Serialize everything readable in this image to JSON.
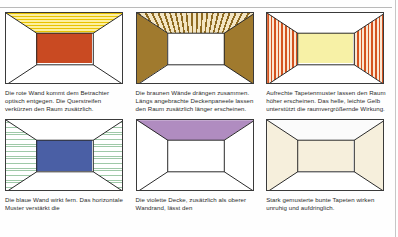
{
  "page": {
    "rule_color": "#b9b9b9"
  },
  "panels": [
    {
      "id": "panel-red-wall",
      "room_name": "room-red-back-wall",
      "caption": "Die rote Wand kommt dem Betrachter optisch entgegen. Die Querstreifen verkürzen den Raum zusätzlich.",
      "surfaces": {
        "ceiling": "yellow horizontal stripes",
        "left_wall": "white",
        "right_wall": "white",
        "back_wall": "red",
        "floor": "white"
      },
      "colors": {
        "back_wall": "#c94a22",
        "ceiling": "#fdf0a0",
        "ceiling_stripe": "#e8c200"
      }
    },
    {
      "id": "panel-brown-walls",
      "room_name": "room-brown-side-walls",
      "caption": "Die braunen Wände drängen zusammen. Längs angebrachte Deckenpaneele lassen den Raum zusätzlich länger erscheinen.",
      "surfaces": {
        "ceiling": "brown radiating panels",
        "left_wall": "brown",
        "right_wall": "brown",
        "back_wall": "white",
        "floor": "white"
      },
      "colors": {
        "side_walls": "#a07a2e",
        "ceiling_panel": "#8e6a20",
        "ceiling_gap": "#f3e5c2"
      }
    },
    {
      "id": "panel-vertical-pattern",
      "room_name": "room-vertical-striped-walls",
      "caption": "Aufrechte Tapetenmuster lassen den Raum höher erscheinen. Das helle, leichte Gelb unterstützt die raumvergrößernde Wirkung.",
      "surfaces": {
        "ceiling": "white",
        "left_wall": "orange vertical stripes",
        "right_wall": "orange vertical stripes",
        "back_wall": "pale yellow",
        "floor": "white"
      },
      "colors": {
        "stripe": "#d4521f",
        "stripe_gap": "#fbe7d2",
        "back_wall": "#f7f1a6"
      }
    },
    {
      "id": "panel-blue-wall",
      "room_name": "room-blue-back-wall",
      "caption": "Die blaue Wand wirkt fern. Das horizontale Muster verstärkt die",
      "surfaces": {
        "ceiling": "white",
        "left_wall": "green horizontal stripes",
        "right_wall": "green horizontal stripes",
        "back_wall": "blue",
        "floor": "white"
      },
      "colors": {
        "back_wall": "#4a5fa5",
        "stripe": "#9fc9a8"
      }
    },
    {
      "id": "panel-violet-ceiling",
      "room_name": "room-violet-ceiling",
      "caption": "Die violette Decke, zusätzlich als oberer Wandrand, lässt den",
      "surfaces": {
        "ceiling": "violet",
        "left_wall": "white",
        "right_wall": "white",
        "back_wall": "white",
        "floor": "white"
      },
      "colors": {
        "ceiling": "#b08cc0"
      }
    },
    {
      "id": "panel-busy-pattern",
      "room_name": "room-speckled-patterned-walls",
      "caption": "Stark gemusterte bunte Tapeten wirken unruhig und aufdringlich.",
      "surfaces": {
        "ceiling": "white",
        "left_wall": "speckled beige pattern",
        "right_wall": "speckled beige pattern",
        "back_wall": "speckled beige pattern",
        "floor": "white"
      },
      "colors": {
        "base": "#f6efdc",
        "speck": "#c8a03c"
      }
    }
  ]
}
